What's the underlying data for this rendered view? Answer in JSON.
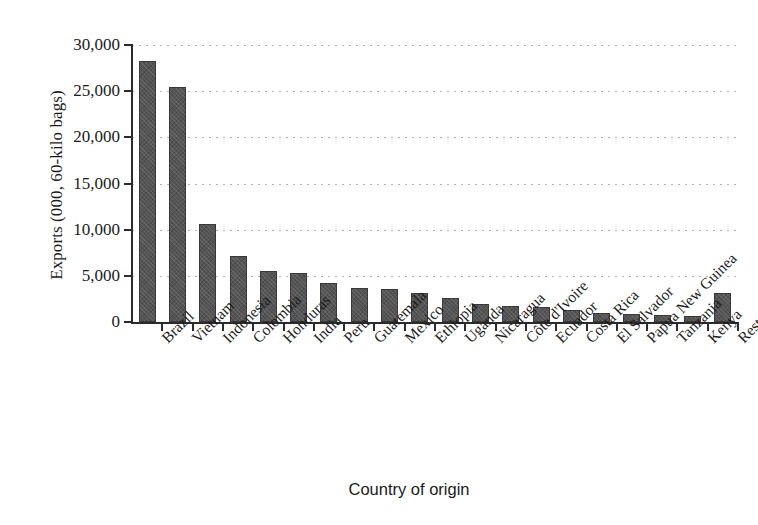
{
  "chart_data": {
    "type": "bar",
    "title": "",
    "xlabel": "Country of origin",
    "ylabel": "Exports (000, 60-kilo bags)",
    "ylim": [
      0,
      30000
    ],
    "ytick_labels": [
      "30,000",
      "25,000",
      "20,000",
      "15,000",
      "10,000",
      "5,000",
      "0"
    ],
    "ytick_values": [
      30000,
      25000,
      20000,
      15000,
      10000,
      5000,
      0
    ],
    "grid": "horizontal-dotted",
    "legend": "none",
    "bar_color": "#555555",
    "categories": [
      "Brazil",
      "Vietnam",
      "Indonesia",
      "Colombia",
      "Honduras",
      "India",
      "Peru",
      "Guatemala",
      "Mexico",
      "Ethiopia",
      "Uganda",
      "Nicaragua",
      "Côte d'Ivoire",
      "Ecuador",
      "Costa Rica",
      "El Salvador",
      "Papua New Guinea",
      "Tanzania",
      "Kenya",
      "Rest of world"
    ],
    "values": [
      28300,
      25400,
      10600,
      7100,
      5500,
      5300,
      4250,
      3700,
      3550,
      3100,
      2600,
      1950,
      1700,
      1600,
      1300,
      950,
      850,
      750,
      650,
      3100
    ]
  }
}
